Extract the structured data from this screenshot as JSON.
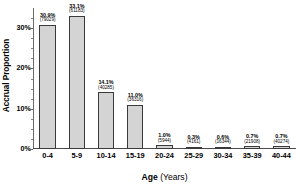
{
  "chart_data": {
    "type": "bar",
    "title": "",
    "xlabel": "Age (Years)",
    "xlabel_main": "Age",
    "xlabel_unit": "(Years)",
    "ylabel": "Accrual Proportion",
    "ylim": [
      0,
      35
    ],
    "ytick_labels": [
      "0%",
      "10%",
      "20%",
      "30%"
    ],
    "ytick_values": [
      0,
      10,
      20,
      30
    ],
    "grid": false,
    "legend": null,
    "categories": [
      "0-4",
      "5-9",
      "10-14",
      "15-19",
      "20-24",
      "25-29",
      "30-34",
      "35-39",
      "40-44"
    ],
    "values": [
      30.9,
      33.1,
      14.1,
      11.0,
      1.0,
      0.3,
      0.6,
      0.7,
      0.7
    ],
    "value_labels": [
      "30.9%",
      "33.1%",
      "14.1%",
      "11.0%",
      "1.0%",
      "0.3%",
      "0.6%",
      "0.7%",
      "0.7%"
    ],
    "count_labels": [
      "(79029)",
      "(61183)",
      "(40285)",
      "(36316)",
      "(5944)",
      "(4161)",
      "(16344)",
      "(21908)",
      "(40274)"
    ],
    "counts": [
      79029,
      61183,
      40285,
      36316,
      5944,
      4161,
      16344,
      21908,
      40274
    ],
    "bar_fill_color": "#d4d4d4",
    "bar_edge_color": "#3a3a3a",
    "axis_color": "#4a4a4a",
    "background_color": "#ffffff"
  }
}
